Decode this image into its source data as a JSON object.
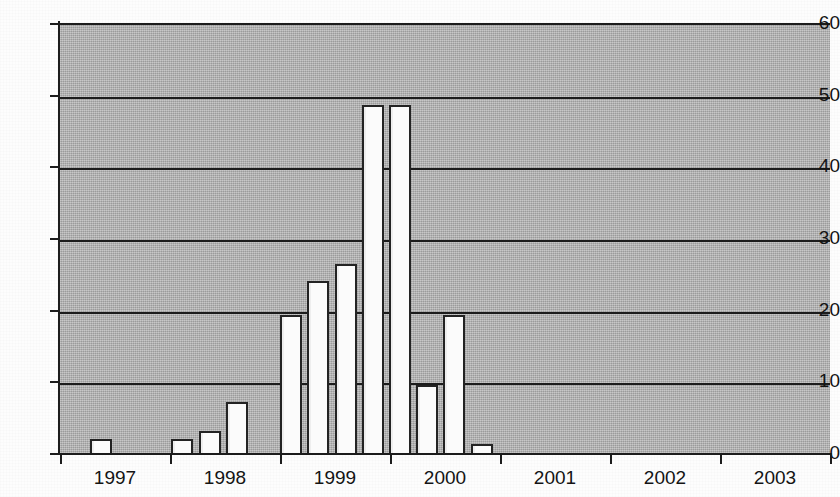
{
  "chart_data": {
    "type": "bar",
    "title": "",
    "subtitle": "",
    "xlabel": "",
    "ylabel": "",
    "xlim_years": [
      1997,
      2004
    ],
    "ylim": [
      0,
      60
    ],
    "y_ticks": [
      0,
      10,
      20,
      30,
      40,
      50,
      60
    ],
    "x_ticks": [
      "1997",
      "1998",
      "1999",
      "2000",
      "2001",
      "2002",
      "2003"
    ],
    "grid": "horizontal",
    "legend": "none",
    "plot_background_color": "#aaaaaa",
    "bar_fill_color": "#fbfbfb",
    "bar_border_color": "#232323",
    "axis_color": "#1c1c1c",
    "bar_interval": "quarterly",
    "categories": [
      "1997 Q1",
      "1997 Q2",
      "1997 Q3",
      "1997 Q4",
      "1998 Q1",
      "1998 Q2",
      "1998 Q3",
      "1998 Q4",
      "1999 Q1",
      "1999 Q2",
      "1999 Q3",
      "1999 Q4",
      "2000 Q1",
      "2000 Q2",
      "2000 Q3",
      "2000 Q4",
      "2001 Q1",
      "2001 Q2",
      "2001 Q3",
      "2001 Q4",
      "2002 Q1",
      "2002 Q2",
      "2002 Q3",
      "2002 Q4",
      "2003 Q1",
      "2003 Q2",
      "2003 Q3",
      "2003 Q4"
    ],
    "values": [
      0,
      2.2,
      0,
      0,
      2.3,
      3.3,
      7.4,
      0,
      19.5,
      24.3,
      26.6,
      48.8,
      48.8,
      9.8,
      19.6,
      1.5,
      0,
      0,
      0,
      0,
      0,
      0,
      0,
      0,
      0,
      0,
      0,
      0
    ]
  },
  "axes": {
    "y_ticks": [
      {
        "label": "60",
        "value": 60
      },
      {
        "label": "50",
        "value": 50
      },
      {
        "label": "40",
        "value": 40
      },
      {
        "label": "30",
        "value": 30
      },
      {
        "label": "20",
        "value": 20
      },
      {
        "label": "10",
        "value": 10
      },
      {
        "label": "0",
        "value": 0
      }
    ],
    "x_ticks": [
      {
        "label": "1997",
        "year": 1997
      },
      {
        "label": "1998",
        "year": 1998
      },
      {
        "label": "1999",
        "year": 1999
      },
      {
        "label": "2000",
        "year": 2000
      },
      {
        "label": "2001",
        "year": 2001
      },
      {
        "label": "2002",
        "year": 2002
      },
      {
        "label": "2003",
        "year": 2003
      }
    ]
  },
  "geometry": {
    "plot_left": 60,
    "plot_top": 23,
    "plot_width": 770,
    "plot_height": 430,
    "baseline_y": 453,
    "year_width": 110,
    "bar_slot_width": 27.2,
    "bar_width": 22
  }
}
